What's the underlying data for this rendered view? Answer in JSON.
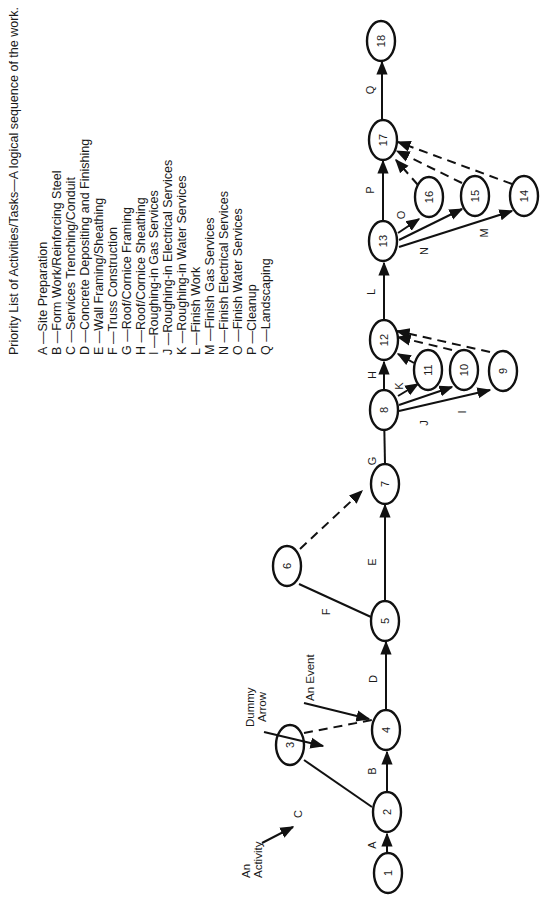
{
  "title": "Priority List of Activities/Tasks—A logical sequence of the work.",
  "activities": [
    {
      "key": "A",
      "label": "A —Site Preparation"
    },
    {
      "key": "B",
      "label": "B —Form Work/Reinforcing Steel"
    },
    {
      "key": "C",
      "label": "C —Services Trenching/Conduit"
    },
    {
      "key": "D",
      "label": "D —Concrete Depositing and Finishing"
    },
    {
      "key": "E",
      "label": "E —Wall Framing/Sheathing"
    },
    {
      "key": "F",
      "label": "F —Truss Construction"
    },
    {
      "key": "G",
      "label": "G —Roof/Cornice Framing"
    },
    {
      "key": "H",
      "label": "H —Roof/Cornice Sheathing"
    },
    {
      "key": "I",
      "label": "I —Roughing-in Gas Services"
    },
    {
      "key": "J",
      "label": "J —Roughing-in Electrical Services"
    },
    {
      "key": "K",
      "label": "K —Roughing-in Water Services"
    },
    {
      "key": "L",
      "label": "L —Finish Work"
    },
    {
      "key": "M",
      "label": "M —Finish Gas Services"
    },
    {
      "key": "N",
      "label": "N —Finish Electrical Services"
    },
    {
      "key": "O",
      "label": "O —Finish Water Services"
    },
    {
      "key": "P",
      "label": "P —Cleanup"
    },
    {
      "key": "Q",
      "label": "Q —Landscaping"
    }
  ],
  "nodes": [
    {
      "id": "1",
      "label": "1"
    },
    {
      "id": "2",
      "label": "2"
    },
    {
      "id": "3",
      "label": "3"
    },
    {
      "id": "4",
      "label": "4"
    },
    {
      "id": "5",
      "label": "5"
    },
    {
      "id": "6",
      "label": "6"
    },
    {
      "id": "7",
      "label": "7"
    },
    {
      "id": "8",
      "label": "8"
    },
    {
      "id": "9",
      "label": "9"
    },
    {
      "id": "10",
      "label": "10"
    },
    {
      "id": "11",
      "label": "11"
    },
    {
      "id": "12",
      "label": "12"
    },
    {
      "id": "13",
      "label": "13"
    },
    {
      "id": "14",
      "label": "14"
    },
    {
      "id": "15",
      "label": "15"
    },
    {
      "id": "16",
      "label": "16"
    },
    {
      "id": "17",
      "label": "17"
    },
    {
      "id": "18",
      "label": "18"
    }
  ],
  "edges": [
    {
      "from": "1",
      "to": "2",
      "activity": "A",
      "type": "solid"
    },
    {
      "from": "2",
      "to": "4",
      "activity": "B",
      "type": "solid"
    },
    {
      "from": "2",
      "to": "3",
      "activity": "C",
      "type": "solid"
    },
    {
      "from": "3",
      "to": "4",
      "activity": "",
      "type": "dummy"
    },
    {
      "from": "4",
      "to": "5",
      "activity": "D",
      "type": "solid"
    },
    {
      "from": "5",
      "to": "7",
      "activity": "E",
      "type": "solid"
    },
    {
      "from": "5",
      "to": "6",
      "activity": "F",
      "type": "solid"
    },
    {
      "from": "6",
      "to": "7",
      "activity": "",
      "type": "dummy"
    },
    {
      "from": "7",
      "to": "8",
      "activity": "G",
      "type": "solid"
    },
    {
      "from": "8",
      "to": "12",
      "activity": "H",
      "type": "solid"
    },
    {
      "from": "8",
      "to": "9",
      "activity": "I",
      "type": "solid"
    },
    {
      "from": "8",
      "to": "10",
      "activity": "J",
      "type": "solid"
    },
    {
      "from": "8",
      "to": "11",
      "activity": "K",
      "type": "solid"
    },
    {
      "from": "9",
      "to": "12",
      "activity": "",
      "type": "dummy"
    },
    {
      "from": "10",
      "to": "12",
      "activity": "",
      "type": "dummy"
    },
    {
      "from": "11",
      "to": "12",
      "activity": "",
      "type": "dummy"
    },
    {
      "from": "12",
      "to": "13",
      "activity": "L",
      "type": "solid"
    },
    {
      "from": "13",
      "to": "14",
      "activity": "M",
      "type": "solid"
    },
    {
      "from": "13",
      "to": "15",
      "activity": "N",
      "type": "solid"
    },
    {
      "from": "13",
      "to": "16",
      "activity": "O",
      "type": "solid"
    },
    {
      "from": "13",
      "to": "17",
      "activity": "P",
      "type": "solid"
    },
    {
      "from": "14",
      "to": "17",
      "activity": "",
      "type": "dummy"
    },
    {
      "from": "15",
      "to": "17",
      "activity": "",
      "type": "dummy"
    },
    {
      "from": "16",
      "to": "17",
      "activity": "",
      "type": "dummy"
    },
    {
      "from": "17",
      "to": "18",
      "activity": "Q",
      "type": "solid"
    }
  ],
  "annotations": {
    "activity": [
      "An",
      "Activity"
    ],
    "dummy_arrow": [
      "Dummy",
      "Arrow"
    ],
    "event": "An Event"
  },
  "edge_labels": {
    "A": "A",
    "B": "B",
    "C": "C",
    "D": "D",
    "E": "E",
    "F": "F",
    "G": "G",
    "H": "H",
    "I": "I",
    "J": "J",
    "K": "K",
    "L": "L",
    "M": "M",
    "N": "N",
    "O": "O",
    "P": "P",
    "Q": "Q"
  }
}
